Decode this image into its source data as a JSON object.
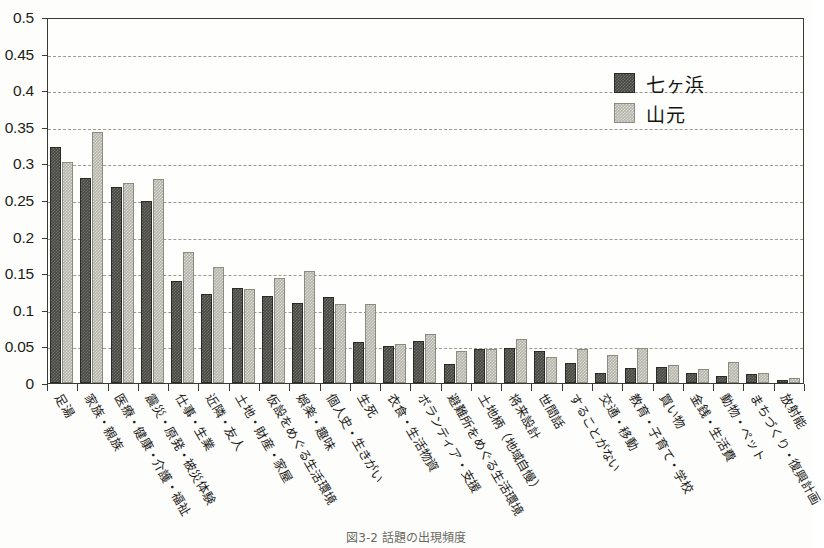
{
  "figure": {
    "caption": "図3-2 話題の出現頻度"
  },
  "legend": {
    "position": "top-right",
    "entries": [
      {
        "label": "七ヶ浜",
        "color": "#4a4a44",
        "name": "series-shichigahama"
      },
      {
        "label": "山元",
        "color": "#b6b6ac",
        "name": "series-yamamoto"
      }
    ]
  },
  "axes": {
    "y_ticks": [
      "0.5",
      "0.45",
      "0.4",
      "0.35",
      "0.3",
      "0.25",
      "0.2",
      "0.15",
      "0.1",
      "0.05",
      "0"
    ],
    "y_min": 0,
    "y_max": 0.5,
    "y_step": 0.05,
    "grid": "horizontal-dashed"
  },
  "chart_data": {
    "type": "bar",
    "title": "",
    "xlabel": "",
    "ylabel": "",
    "ylim": [
      0,
      0.5
    ],
    "grid": true,
    "legend_position": "top-right",
    "categories": [
      "足湯",
      "家族・親族",
      "医療・健康・介護・福祉",
      "震災・原発・被災体験",
      "仕事・生業",
      "近隣・友人",
      "土地・財産・家屋",
      "仮設をめぐる生活環境",
      "娯楽・趣味",
      "個人史・生きがい",
      "生死",
      "衣食・生活物資",
      "ボランティア・支援",
      "避難所をめぐる生活環境",
      "土地柄（地域自慢）",
      "将来設計",
      "世間話",
      "することがない",
      "交通・移動",
      "教育・子育て・学校",
      "買い物",
      "金銭・生活費",
      "動物・ペット",
      "まちづくり・復興計画",
      "放射能"
    ],
    "series": [
      {
        "name": "七ヶ浜",
        "color": "#4a4a44",
        "values": [
          0.322,
          0.28,
          0.268,
          0.248,
          0.139,
          0.122,
          0.13,
          0.119,
          0.109,
          0.118,
          0.056,
          0.051,
          0.058,
          0.026,
          0.046,
          0.048,
          0.044,
          0.028,
          0.014,
          0.02,
          0.022,
          0.014,
          0.01,
          0.012,
          0.004
        ]
      },
      {
        "name": "山元",
        "color": "#b6b6ac",
        "values": [
          0.302,
          0.343,
          0.273,
          0.279,
          0.179,
          0.159,
          0.128,
          0.144,
          0.153,
          0.108,
          0.108,
          0.053,
          0.067,
          0.044,
          0.047,
          0.06,
          0.035,
          0.046,
          0.038,
          0.048,
          0.024,
          0.019,
          0.029,
          0.013,
          0.007
        ]
      }
    ]
  }
}
